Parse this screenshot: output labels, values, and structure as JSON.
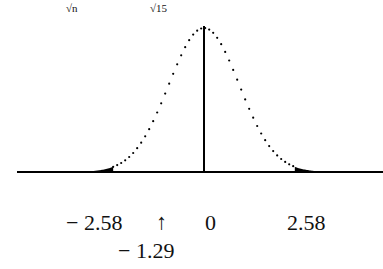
{
  "top_labels": {
    "left": "√n",
    "right": "√15"
  },
  "axis_labels": {
    "neg_crit": "− 2.58",
    "arrow": "↑",
    "zero": "0",
    "pos_crit": "2.58",
    "marked": "− 1.29"
  },
  "chart_data": {
    "type": "area",
    "distribution": "standard normal",
    "critical_values": [
      -2.58,
      2.58
    ],
    "center": 0,
    "marked_value": -1.29,
    "shaded_regions": [
      "z < -2.58",
      "z > 2.58"
    ],
    "tick_labels": [
      "-2.58",
      "0",
      "2.58"
    ],
    "annotation": "arrow pointing to -1.29"
  }
}
